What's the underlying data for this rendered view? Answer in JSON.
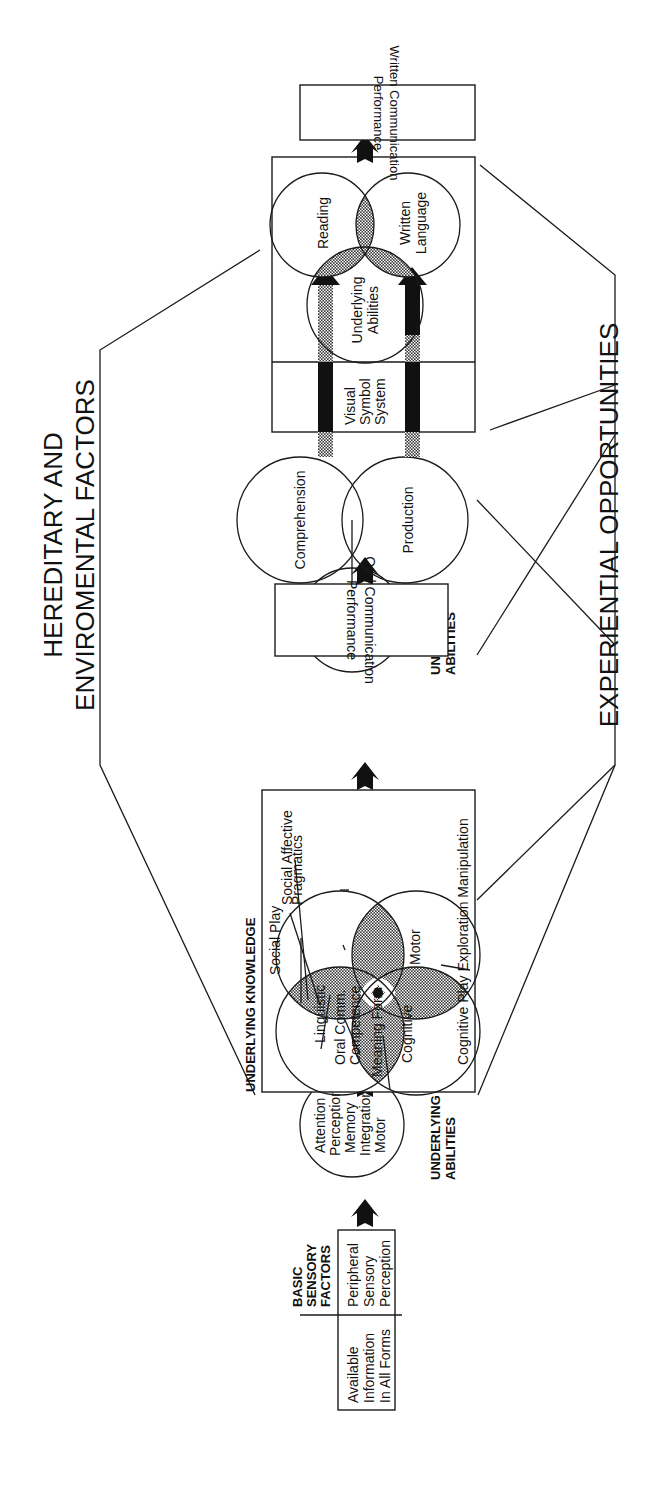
{
  "headings": {
    "top_line1": "HEREDITARY AND",
    "top_line2": "ENVIROMENTAL FACTORS",
    "bottom": "EXPERIENTIAL OPPORTUNITIES"
  },
  "basic_sensory": {
    "label_line1": "BASIC",
    "label_line2": "SENSORY",
    "label_line3": "FACTORS",
    "available": [
      "Available",
      "Information",
      "In All Forms"
    ],
    "peripheral": [
      "Peripheral",
      "Sensory",
      "Perception"
    ]
  },
  "abilities_1": {
    "items": [
      "Attention",
      "Perception",
      "Memory",
      "Integration",
      "Motor"
    ],
    "label_line1": "UNDERLYING",
    "label_line2": "ABILITIES"
  },
  "knowledge": {
    "title": "UNDERLYING KNOWLEDGE",
    "circles": {
      "linguistic": "Linguistic",
      "cognitive": "Cognitive",
      "social_affective": "Social Affective",
      "motor": "Motor"
    },
    "overlaps": {
      "social_play": "Social Play",
      "pragmatics": "Pragmatics",
      "oral_comm_line1": "Oral Comm.",
      "oral_comm_line2": "Competence",
      "meaning_form": "Meaning Form",
      "cognitive_play": "Cognitive Play Exploration Manipulation"
    }
  },
  "abilities_2": {
    "items": [
      "Attention",
      "Perception",
      "Memory",
      "Integration",
      "Motor"
    ],
    "label_line1": "UNDERLYING",
    "label_line2": "ABILITIES"
  },
  "oral_performance": {
    "line1": "Oral Communication",
    "line2": "Performance"
  },
  "oral_venn": {
    "comprehension": "Comprehension",
    "production": "Production"
  },
  "written": {
    "visual_symbol": [
      "Visual",
      "Symbol",
      "System"
    ],
    "reading": "Reading",
    "written_language_line1": "Written",
    "written_language_line2": "Language",
    "underlying_line1": "Underlying",
    "underlying_line2": "Abilities"
  },
  "written_performance": {
    "line1": "Written Communication",
    "line2": "Performance"
  },
  "colors": {
    "ink": "#1a1a1a",
    "hatch": "#8a8a8a",
    "background": "#ffffff"
  }
}
